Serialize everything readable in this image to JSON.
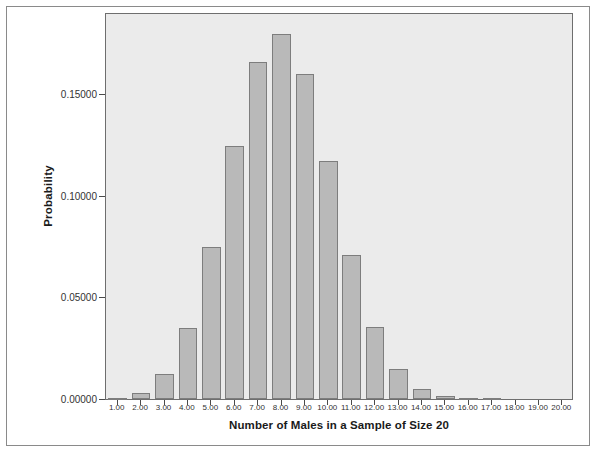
{
  "page": {
    "clipped_top_text": ""
  },
  "chart_data": {
    "type": "bar",
    "title": "",
    "xlabel": "Number of Males in a Sample of Size 20",
    "ylabel": "Probability",
    "categories": [
      "1.00",
      "2.00",
      "3.00",
      "4.00",
      "5.00",
      "6.00",
      "7.00",
      "8.00",
      "9.00",
      "10.00",
      "11.00",
      "12.00",
      "13.00",
      "14.00",
      "15.00",
      "16.00",
      "17.00",
      "18.00",
      "19.00",
      "20.00"
    ],
    "x": [
      1,
      2,
      3,
      4,
      5,
      6,
      7,
      8,
      9,
      10,
      11,
      12,
      13,
      14,
      15,
      16,
      17,
      18,
      19,
      20
    ],
    "values": [
      0.00049,
      0.00309,
      0.01235,
      0.03499,
      0.07465,
      0.12441,
      0.16588,
      0.17971,
      0.15974,
      0.11714,
      0.07099,
      0.0355,
      0.01456,
      0.00486,
      0.00129,
      0.00026,
      4e-05,
      0.0,
      0.0,
      0.0
    ],
    "ytick_labels": [
      "0.00000",
      "0.05000",
      "0.10000",
      "0.15000"
    ],
    "ytick_values": [
      0.0,
      0.05,
      0.1,
      0.15
    ],
    "ylim": [
      0,
      0.19
    ],
    "xlim": [
      0.5,
      20.5
    ],
    "grid": false,
    "legend": false,
    "bar_fill": "#b9b9b9",
    "bar_edge": "#7d7d7d",
    "panel_bg": "#ebebeb",
    "panel_border": "#6e6e6e"
  }
}
